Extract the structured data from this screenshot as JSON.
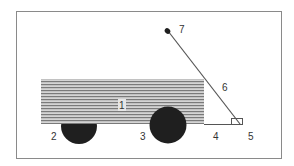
{
  "diagram": {
    "type": "wagon-parts",
    "colors": {
      "frame": "#8a8a8a",
      "body_fill": "#cfcfcf",
      "body_stripe": "#7a7a7a",
      "wheel": "#1f1f1f",
      "line": "#555555",
      "label": "#333333"
    },
    "labels": [
      {
        "id": "1",
        "text": "1",
        "part": "wagon-body"
      },
      {
        "id": "2",
        "text": "2",
        "part": "rear-wheel"
      },
      {
        "id": "3",
        "text": "3",
        "part": "front-wheel"
      },
      {
        "id": "4",
        "text": "4",
        "part": "base-line"
      },
      {
        "id": "5",
        "text": "5",
        "part": "pivot"
      },
      {
        "id": "6",
        "text": "6",
        "part": "handle"
      },
      {
        "id": "7",
        "text": "7",
        "part": "handle-grip"
      }
    ]
  }
}
